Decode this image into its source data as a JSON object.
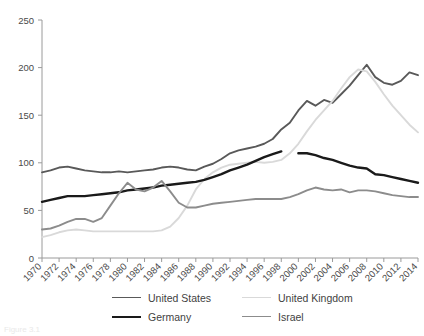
{
  "chart_data": {
    "type": "line",
    "title": "",
    "subtitle": "",
    "xlabel": "",
    "ylabel": "",
    "xlim": [
      1970,
      2014
    ],
    "ylim": [
      0,
      250
    ],
    "grid": false,
    "legend_position": "bottom",
    "yticks": [
      0,
      50,
      100,
      150,
      200,
      250
    ],
    "xticks": [
      1970,
      1972,
      1974,
      1976,
      1978,
      1980,
      1982,
      1984,
      1986,
      1988,
      1990,
      1992,
      1994,
      1996,
      1998,
      2000,
      2002,
      2004,
      2006,
      2008,
      2010,
      2012,
      2014
    ],
    "x": [
      1970,
      1971,
      1972,
      1973,
      1974,
      1975,
      1976,
      1977,
      1978,
      1979,
      1980,
      1981,
      1982,
      1983,
      1984,
      1985,
      1986,
      1987,
      1988,
      1989,
      1990,
      1991,
      1992,
      1993,
      1994,
      1995,
      1996,
      1997,
      1998,
      1999,
      2000,
      2001,
      2002,
      2003,
      2004,
      2005,
      2006,
      2007,
      2008,
      2009,
      2010,
      2011,
      2012,
      2013,
      2014
    ],
    "series": [
      {
        "name": "United States",
        "color": "#595959",
        "width": 1.9,
        "values": [
          90,
          92,
          95,
          96,
          94,
          92,
          91,
          90,
          90,
          91,
          90,
          91,
          92,
          93,
          95,
          96,
          95,
          93,
          92,
          96,
          99,
          104,
          110,
          113,
          115,
          117,
          120,
          125,
          135,
          142,
          155,
          165,
          160,
          166,
          163,
          172,
          181,
          192,
          203,
          190,
          184,
          182,
          186,
          195,
          192
        ]
      },
      {
        "name": "United Kingdom",
        "color": "#d9d9d9",
        "width": 1.9,
        "values": [
          22,
          24,
          27,
          29,
          30,
          29,
          28,
          28,
          28,
          28,
          28,
          28,
          28,
          28,
          29,
          33,
          42,
          55,
          72,
          83,
          90,
          95,
          98,
          99,
          100,
          101,
          100,
          101,
          103,
          110,
          120,
          133,
          145,
          155,
          165,
          178,
          190,
          198,
          196,
          185,
          172,
          160,
          150,
          140,
          132
        ]
      },
      {
        "name": "Germany",
        "color": "#1a1a1a",
        "width": 2.4,
        "values": [
          59,
          61,
          63,
          65,
          65,
          65,
          66,
          67,
          68,
          69,
          71,
          72,
          73,
          74,
          76,
          77,
          78,
          79,
          80,
          82,
          85,
          88,
          92,
          95,
          98,
          102,
          106,
          109,
          112,
          null,
          110,
          110,
          108,
          105,
          103,
          100,
          97,
          95,
          94,
          88,
          87,
          85,
          83,
          81,
          79
        ]
      },
      {
        "name": "Israel",
        "color": "#8c8c8c",
        "width": 1.9,
        "values": [
          30,
          31,
          34,
          38,
          41,
          41,
          38,
          42,
          55,
          68,
          79,
          72,
          70,
          74,
          81,
          70,
          58,
          53,
          53,
          55,
          57,
          58,
          59,
          60,
          61,
          62,
          62,
          62,
          62,
          64,
          67,
          71,
          74,
          72,
          71,
          72,
          69,
          71,
          71,
          70,
          68,
          66,
          65,
          64,
          64
        ]
      }
    ]
  },
  "legend": {
    "items": [
      {
        "label": "United States",
        "color": "#595959",
        "width": 1.9
      },
      {
        "label": "United Kingdom",
        "color": "#d9d9d9",
        "width": 1.9
      },
      {
        "label": "Germany",
        "color": "#1a1a1a",
        "width": 2.4
      },
      {
        "label": "Israel",
        "color": "#8c8c8c",
        "width": 1.9
      }
    ]
  },
  "caption": {
    "text": "Figure 3.1"
  }
}
